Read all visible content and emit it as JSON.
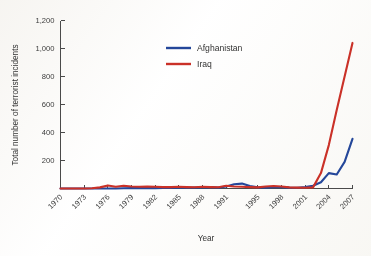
{
  "chart_data": {
    "type": "line",
    "title": "",
    "xlabel": "Year",
    "ylabel": "Total number of terrorist incidents",
    "xlim": [
      1970,
      2007
    ],
    "ylim": [
      0,
      1200
    ],
    "grid": false,
    "legend_position": "upper-center",
    "xtick_labels": [
      "1970",
      "1973",
      "1976",
      "1979",
      "1982",
      "1985",
      "1988",
      "1991",
      "1995",
      "1998",
      "2001",
      "2004",
      "2007"
    ],
    "xtick_values": [
      1970,
      1973,
      1976,
      1979,
      1982,
      1985,
      1988,
      1991,
      1995,
      1998,
      2001,
      2004,
      2007
    ],
    "ytick_labels": [
      "0",
      "200",
      "400",
      "600",
      "800",
      "1,000",
      "1,200"
    ],
    "ytick_values": [
      0,
      200,
      400,
      600,
      800,
      1000,
      1200
    ],
    "x": [
      1970,
      1971,
      1972,
      1973,
      1974,
      1975,
      1976,
      1977,
      1978,
      1979,
      1980,
      1981,
      1982,
      1983,
      1984,
      1985,
      1986,
      1987,
      1988,
      1989,
      1990,
      1991,
      1992,
      1993,
      1994,
      1995,
      1996,
      1997,
      1998,
      1999,
      2000,
      2001,
      2002,
      2003,
      2004,
      2005,
      2006,
      2007
    ],
    "series": [
      {
        "name": "Afghanistan",
        "color": "#23479d",
        "values": [
          0,
          0,
          0,
          0,
          0,
          0,
          0,
          0,
          2,
          3,
          4,
          3,
          3,
          4,
          4,
          5,
          5,
          6,
          8,
          10,
          6,
          14,
          30,
          35,
          18,
          8,
          6,
          9,
          10,
          6,
          5,
          10,
          20,
          45,
          110,
          100,
          190,
          355
        ]
      },
      {
        "name": "Iraq",
        "color": "#cf3026",
        "values": [
          0,
          0,
          0,
          0,
          2,
          8,
          22,
          12,
          20,
          14,
          12,
          14,
          12,
          10,
          10,
          12,
          10,
          9,
          12,
          10,
          9,
          20,
          14,
          12,
          10,
          8,
          14,
          18,
          14,
          8,
          6,
          5,
          8,
          110,
          310,
          560,
          800,
          1040
        ]
      }
    ],
    "annotations": []
  },
  "legend": {
    "items": [
      {
        "label": "Afghanistan",
        "color": "#23479d"
      },
      {
        "label": "Iraq",
        "color": "#cf3026"
      }
    ]
  },
  "axes": {
    "y_title": "Total number of terrorist incidents",
    "x_title": "Year"
  },
  "colors": {
    "afghanistan": "#23479d",
    "iraq": "#cf3026",
    "axis": "#4a4a4a",
    "text": "#3c3c3c",
    "background": "#fbfaf8"
  }
}
